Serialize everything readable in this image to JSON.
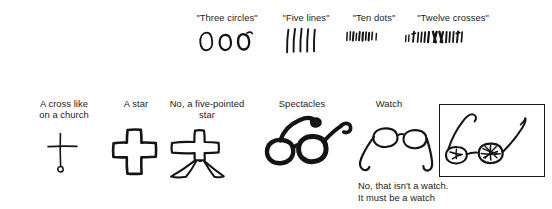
{
  "figure": {
    "background_color": "#ffffff",
    "ink_color": "#141414",
    "text_color": "#1c1c1c"
  },
  "top_row": {
    "items": [
      {
        "label": "\"Three circles\"",
        "drawing_name": "three-circles-sketch",
        "drawn_count": 3,
        "drawn_shape": "circle"
      },
      {
        "label": "\"Five lines\"",
        "drawing_name": "five-lines-sketch",
        "drawn_count": 5,
        "drawn_shape": "vertical-stroke"
      },
      {
        "label": "\"Ten dots\"",
        "drawing_name": "ten-dots-sketch",
        "drawn_count": 10,
        "drawn_shape": "short-tick"
      },
      {
        "label": "\"Twelve crosses\"",
        "drawing_name": "twelve-crosses-sketch",
        "drawn_count": 12,
        "drawn_shape": "slanted-stroke"
      }
    ]
  },
  "bottom_row": {
    "items": [
      {
        "label": "A cross like\non a church",
        "drawing_name": "thin-cross-sketch"
      },
      {
        "label": "A star",
        "drawing_name": "block-cross-sketch"
      },
      {
        "label": "No, a five-pointed\nstar",
        "drawing_name": "five-pointed-star-sketch"
      },
      {
        "label": "Spectacles",
        "drawing_name": "dark-spectacles-sketch"
      },
      {
        "label": "Watch",
        "drawing_name": "light-spectacles-sketch"
      }
    ],
    "framed_drawing": {
      "name": "framed-spectacles-sketch",
      "border_color": "#171717"
    },
    "watch_caption": "No, that isn't a watch.\nIt must be a watch"
  }
}
